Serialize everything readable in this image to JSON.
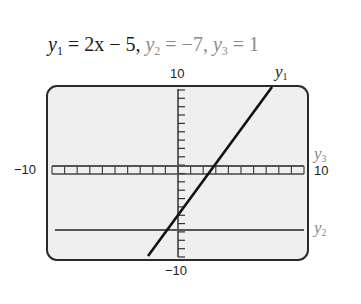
{
  "header": {
    "eq1_lhs": "y",
    "eq1_sub": "1",
    "eq1_rhs": " = 2x − 5, ",
    "eq2_lhs": "y",
    "eq2_sub": "2",
    "eq2_rhs": " = −7, ",
    "eq3_lhs": "y",
    "eq3_sub": "3",
    "eq3_rhs": " = 1"
  },
  "labels": {
    "y_max": "10",
    "y_min": "−10",
    "x_min": "−10",
    "x_max": "10",
    "curve1_name": "y",
    "curve1_sub": "1",
    "curve2_name": "y",
    "curve2_sub": "2",
    "curve3_name": "y",
    "curve3_sub": "3"
  },
  "colors": {
    "frame_fill": "#efefef",
    "frame_stroke": "#2a2a2a",
    "y1_line": "#111111",
    "y2_line": "#555555",
    "y3_line": "#555555",
    "axis": "#333333"
  },
  "chart_data": {
    "type": "line",
    "title": "y1 = 2x − 5, y2 = −7, y3 = 1",
    "xlabel": "",
    "ylabel": "",
    "xlim": [
      -10,
      10
    ],
    "ylim": [
      -10,
      10
    ],
    "grid": false,
    "x_tick_step": 1,
    "y_tick_step": 1,
    "series": [
      {
        "name": "y1",
        "expression": "2x - 5",
        "x": [
          -2.5,
          7.5
        ],
        "values": [
          -10,
          10
        ]
      },
      {
        "name": "y2",
        "expression": "-7",
        "x": [
          -10,
          10
        ],
        "values": [
          -7,
          -7
        ]
      },
      {
        "name": "y3",
        "expression": "1",
        "x": [
          -10,
          10
        ],
        "values": [
          1,
          1
        ]
      }
    ],
    "axis_labels_shown": {
      "x_left": "−10",
      "x_right": "10",
      "y_top": "10",
      "y_bottom": "−10"
    }
  }
}
